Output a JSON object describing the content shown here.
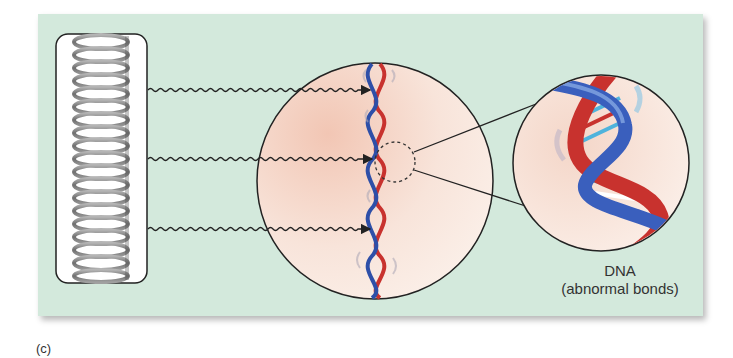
{
  "figure": {
    "panel_label": "(c)",
    "labels": {
      "dna_title": "DNA",
      "dna_subtitle": "(abnormal bonds)"
    },
    "elements": {
      "source": "coiled-lamp-icon",
      "rays": 3,
      "magnified_view": "dna-helix-segment",
      "zoomed_view": "dna-helix-closeup"
    },
    "colors": {
      "panel_bg": "#d3e9dc",
      "circle_fill": "#f6ddd0",
      "strand_red": "#c8322e",
      "strand_blue": "#2e4fa8",
      "base_light_blue": "#4fb3dc",
      "spring_gray": "#8a8a8a"
    }
  }
}
